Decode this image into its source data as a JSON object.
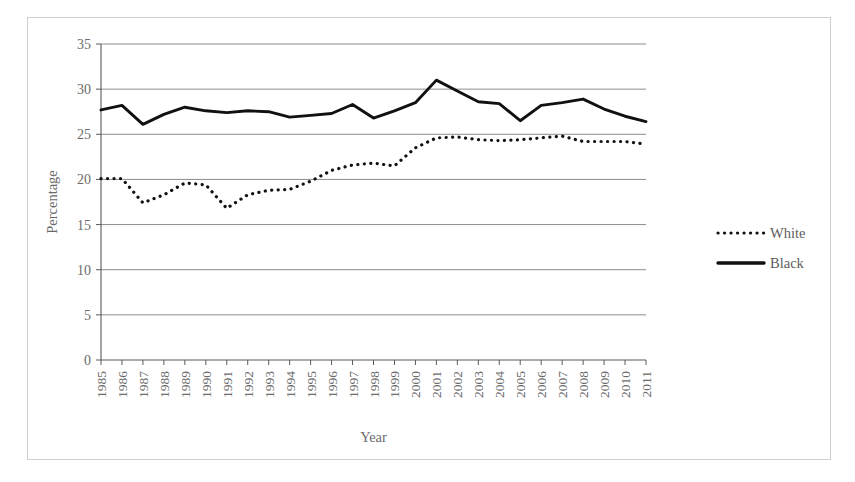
{
  "chart_data": {
    "type": "line",
    "title": "",
    "xlabel": "Year",
    "ylabel": "Percentage",
    "ylim": [
      0,
      35
    ],
    "yticks": [
      0,
      5,
      10,
      15,
      20,
      25,
      30,
      35
    ],
    "grid": true,
    "legend_position": "right",
    "categories": [
      "1985",
      "1986",
      "1987",
      "1988",
      "1989",
      "1990",
      "1991",
      "1992",
      "1993",
      "1994",
      "1995",
      "1996",
      "1997",
      "1998",
      "1999",
      "2000",
      "2001",
      "2002",
      "2003",
      "2004",
      "2005",
      "2006",
      "2007",
      "2008",
      "2009",
      "2010",
      "2011"
    ],
    "series": [
      {
        "name": "White",
        "style": "dotted",
        "color": "#111111",
        "values": [
          20.1,
          20.1,
          17.4,
          18.3,
          19.6,
          19.4,
          16.8,
          18.3,
          18.8,
          18.9,
          19.8,
          21.0,
          21.6,
          21.8,
          21.5,
          23.5,
          24.6,
          24.7,
          24.4,
          24.3,
          24.4,
          24.6,
          24.8,
          24.2,
          24.2,
          24.2,
          23.9
        ]
      },
      {
        "name": "Black",
        "style": "solid",
        "color": "#111111",
        "values": [
          27.7,
          28.2,
          26.1,
          27.2,
          28.0,
          27.6,
          27.4,
          27.6,
          27.5,
          26.9,
          27.1,
          27.3,
          28.3,
          26.8,
          27.6,
          28.5,
          31.0,
          29.8,
          28.6,
          28.4,
          26.5,
          28.2,
          28.5,
          28.9,
          27.8,
          27.0,
          26.4
        ]
      }
    ]
  },
  "legend": {
    "items": [
      {
        "label": "White",
        "style": "dotted"
      },
      {
        "label": "Black",
        "style": "solid"
      }
    ]
  },
  "axes": {
    "y_title": "Percentage",
    "x_title": "Year"
  }
}
